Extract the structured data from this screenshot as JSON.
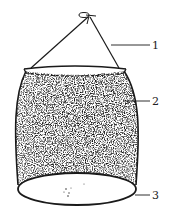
{
  "diagram": {
    "labels": [
      {
        "id": "1",
        "text": "1",
        "part": "hanging cord"
      },
      {
        "id": "2",
        "text": "2",
        "part": "mesh bag body"
      },
      {
        "id": "3",
        "text": "3",
        "part": "bottom ring"
      }
    ],
    "colors": {
      "ink": "#1a1a1a",
      "background": "#ffffff"
    }
  }
}
